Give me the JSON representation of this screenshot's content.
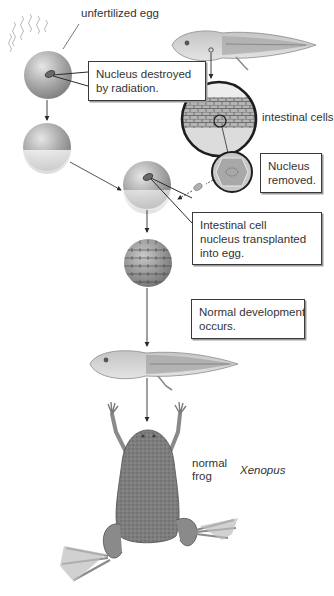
{
  "diagram": {
    "colors": {
      "background": "#ffffff",
      "outline": "#3a3a3a",
      "text": "#333333",
      "egg_gray": "#9c9c9c",
      "frog_gray": "#7d7d7d"
    },
    "labels": {
      "unfertilized_egg": "unfertilized egg",
      "intestinal_cells": "intestinal cells",
      "normal_frog_line1": "normal",
      "normal_frog_line2": "frog",
      "species": "Xenopus"
    },
    "callouts": {
      "nucleus_destroyed": [
        "Nucleus destroyed",
        "by radiation."
      ],
      "nucleus_removed": [
        "Nucleus",
        "removed."
      ],
      "transplanted": [
        "Intestinal cell",
        "nucleus transplanted",
        "into egg."
      ],
      "development": [
        "Normal development",
        "occurs."
      ]
    },
    "steps": [
      "unfertilized egg irradiated",
      "enucleated egg",
      "tadpole intestinal cells",
      "isolated intestinal cell",
      "egg with transplanted nucleus",
      "blastula",
      "tadpole",
      "normal frog"
    ]
  }
}
